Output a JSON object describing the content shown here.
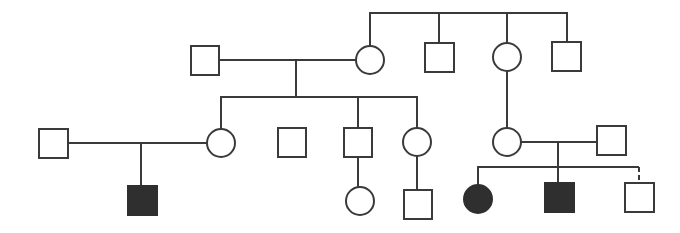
{
  "diagram": {
    "type": "pedigree chart",
    "colors": {
      "line": "#3a3a3a",
      "unaffected_fill": "#ffffff",
      "affected_fill": "#2f2f2f",
      "background": "#ffffff"
    },
    "individuals": [
      {
        "id": "I-1",
        "sex": "male",
        "affected": false,
        "generation": 1
      },
      {
        "id": "I-2",
        "sex": "female",
        "affected": false,
        "generation": 1
      },
      {
        "id": "I-3",
        "sex": "male",
        "affected": false,
        "generation": 1
      },
      {
        "id": "I-4",
        "sex": "female",
        "affected": false,
        "generation": 1
      },
      {
        "id": "I-5",
        "sex": "male",
        "affected": false,
        "generation": 1
      },
      {
        "id": "II-1",
        "sex": "male",
        "affected": false,
        "generation": 2
      },
      {
        "id": "II-2",
        "sex": "female",
        "affected": false,
        "generation": 2
      },
      {
        "id": "II-3",
        "sex": "male",
        "affected": false,
        "generation": 2
      },
      {
        "id": "II-4",
        "sex": "male",
        "affected": false,
        "generation": 2
      },
      {
        "id": "II-5",
        "sex": "female",
        "affected": false,
        "generation": 2
      },
      {
        "id": "II-6",
        "sex": "female",
        "affected": false,
        "generation": 2
      },
      {
        "id": "II-7",
        "sex": "male",
        "affected": false,
        "generation": 2
      },
      {
        "id": "III-1",
        "sex": "male",
        "affected": true,
        "generation": 3
      },
      {
        "id": "III-2",
        "sex": "female",
        "affected": false,
        "generation": 3
      },
      {
        "id": "III-3",
        "sex": "male",
        "affected": false,
        "generation": 3
      },
      {
        "id": "III-4",
        "sex": "female",
        "affected": true,
        "generation": 3
      },
      {
        "id": "III-5",
        "sex": "male",
        "affected": true,
        "generation": 3
      },
      {
        "id": "III-6",
        "sex": "male",
        "affected": false,
        "generation": 3
      }
    ]
  }
}
